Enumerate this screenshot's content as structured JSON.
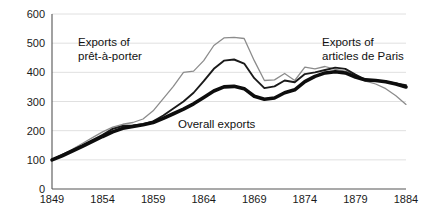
{
  "chart_data": {
    "type": "line",
    "title": "",
    "subtitle": "",
    "xlabel": "",
    "ylabel": "",
    "xlim": [
      1849,
      1884
    ],
    "ylim": [
      0,
      600
    ],
    "grid": true,
    "grid_axis": "y",
    "legend_position": "inline-annotations",
    "x": [
      1849,
      1850,
      1851,
      1852,
      1853,
      1854,
      1855,
      1856,
      1857,
      1858,
      1859,
      1860,
      1861,
      1862,
      1863,
      1864,
      1865,
      1866,
      1867,
      1868,
      1869,
      1870,
      1871,
      1872,
      1873,
      1874,
      1875,
      1876,
      1877,
      1878,
      1879,
      1880,
      1881,
      1882,
      1883,
      1884
    ],
    "y_ticks": [
      0,
      100,
      200,
      300,
      400,
      500,
      600
    ],
    "y_tick_labels": [
      "0",
      "100",
      "200",
      "300",
      "400",
      "500",
      "600"
    ],
    "x_ticks": [
      1849,
      1854,
      1859,
      1864,
      1869,
      1874,
      1879,
      1884
    ],
    "x_tick_labels": [
      "1849",
      "1854",
      "1859",
      "1864",
      "1869",
      "1874",
      "1879",
      "1884"
    ],
    "series": [
      {
        "name": "Exports of prêt-à-porter",
        "color": "#8c8c8c",
        "width": 1.3,
        "values": [
          100,
          118,
          136,
          156,
          176,
          196,
          212,
          222,
          228,
          240,
          268,
          310,
          352,
          400,
          404,
          440,
          492,
          518,
          520,
          516,
          440,
          372,
          374,
          396,
          372,
          418,
          412,
          420,
          410,
          404,
          392,
          370,
          360,
          344,
          320,
          290
        ]
      },
      {
        "name": "Exports of articles de Paris",
        "color": "#1a1a1a",
        "width": 1.9,
        "values": [
          100,
          116,
          133,
          150,
          168,
          186,
          206,
          216,
          218,
          222,
          232,
          252,
          276,
          300,
          330,
          370,
          412,
          440,
          444,
          430,
          380,
          346,
          352,
          372,
          366,
          394,
          400,
          408,
          416,
          412,
          392,
          374,
          372,
          368,
          362,
          356
        ]
      },
      {
        "name": "Overall exports",
        "color": "#0d0d0d",
        "width": 3.6,
        "values": [
          100,
          114,
          130,
          146,
          163,
          180,
          196,
          208,
          214,
          220,
          228,
          242,
          258,
          274,
          292,
          314,
          336,
          350,
          352,
          344,
          318,
          308,
          312,
          330,
          340,
          368,
          386,
          398,
          402,
          398,
          384,
          374,
          372,
          368,
          360,
          350
        ]
      }
    ],
    "annotations": [
      {
        "name": "pret-a-porter-label",
        "lines": [
          "Exports of",
          "prêt-à-porter"
        ],
        "x_px": 78,
        "y_px": 46
      },
      {
        "name": "articles-de-paris-label",
        "lines": [
          "Exports of",
          "articles de Paris"
        ],
        "x_px": 322,
        "y_px": 46
      },
      {
        "name": "overall-exports-label",
        "lines": [
          "Overall exports"
        ],
        "x_px": 178,
        "y_px": 128
      }
    ]
  }
}
